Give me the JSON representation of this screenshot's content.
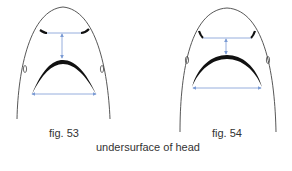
{
  "figures": [
    {
      "id": "fig53",
      "label": "fig. 53"
    },
    {
      "id": "fig54",
      "label": "fig. 54"
    }
  ],
  "caption": "undersurface of head",
  "colors": {
    "outline": "#444444",
    "mouth": "#111111",
    "measure_arrow": "#7b9bd4"
  }
}
